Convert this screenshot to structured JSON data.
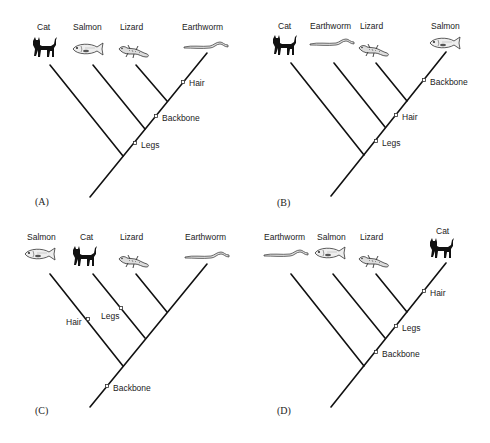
{
  "figure": {
    "panels": [
      {
        "id": "A",
        "label": "(A)",
        "taxa": [
          "Cat",
          "Salmon",
          "Lizard",
          "Earthworm"
        ],
        "characters": [
          "Hair",
          "Backbone",
          "Legs"
        ]
      },
      {
        "id": "B",
        "label": "(B)",
        "taxa": [
          "Cat",
          "Earthworm",
          "Lizard",
          "Salmon"
        ],
        "characters": [
          "Backbone",
          "Hair",
          "Legs"
        ]
      },
      {
        "id": "C",
        "label": "(C)",
        "taxa": [
          "Salmon",
          "Cat",
          "Lizard",
          "Earthworm"
        ],
        "characters": [
          "Hair",
          "Legs",
          "Backbone"
        ]
      },
      {
        "id": "D",
        "label": "(D)",
        "taxa": [
          "Earthworm",
          "Salmon",
          "Lizard",
          "Cat"
        ],
        "characters": [
          "Hair",
          "Legs",
          "Backbone"
        ]
      }
    ]
  }
}
